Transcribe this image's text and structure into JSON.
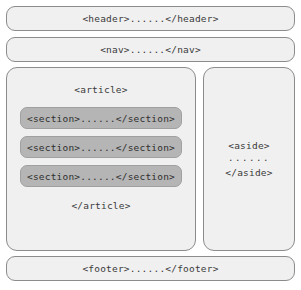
{
  "diagram": {
    "colors": {
      "box_fill": "#f0f0f0",
      "box_border": "#8c8c8c",
      "section_fill": "#b5b5b5",
      "section_border": "#a0a0a0",
      "text": "#3a3a3a",
      "page_background": "#ffffff"
    },
    "header": {
      "label": "<header>......</header>"
    },
    "nav": {
      "label": "<nav>......</nav>"
    },
    "article": {
      "open_tag": "<article>",
      "close_tag": "</article>",
      "sections": [
        {
          "label": "<section>......</section>"
        },
        {
          "label": "<section>......</section>"
        },
        {
          "label": "<section>......</section>"
        }
      ]
    },
    "aside": {
      "open_tag": "<aside>",
      "dots": "......",
      "close_tag": "</aside>"
    },
    "footer": {
      "label": "<footer>......</footer>"
    }
  }
}
